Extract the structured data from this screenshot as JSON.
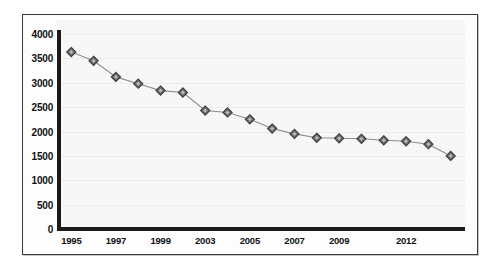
{
  "chart_data": {
    "type": "line",
    "title": "",
    "subtitle": "",
    "xlabel": "",
    "ylabel": "",
    "ylim": [
      0,
      4000
    ],
    "grid": true,
    "legend": null,
    "y_ticks": [
      "0",
      "500",
      "1000",
      "1500",
      "2000",
      "2500",
      "3000",
      "3500",
      "4000"
    ],
    "y_tick_values": [
      0,
      500,
      1000,
      1500,
      2000,
      2500,
      3000,
      3500,
      4000
    ],
    "x_tick_labels": [
      "1995",
      "1997",
      "1999",
      "2003",
      "2005",
      "2007",
      "2009",
      "2012"
    ],
    "x_tick_indices": [
      0,
      2,
      4,
      6,
      8,
      10,
      12,
      15
    ],
    "categories": [
      "1995",
      "1996",
      "1997",
      "1998",
      "1999",
      "2000",
      "2003",
      "2004",
      "2005",
      "2006",
      "2007",
      "2008",
      "2009",
      "2010",
      "2011",
      "2012",
      "2013",
      "2014"
    ],
    "values": [
      3630,
      3450,
      3120,
      2980,
      2840,
      2800,
      2430,
      2390,
      2250,
      2060,
      1950,
      1870,
      1860,
      1850,
      1820,
      1800,
      1740,
      1500
    ],
    "marker": "diamond",
    "marker_fill": "#6e6e6e",
    "marker_stroke": "#3b3b3b",
    "line_color": "#8d8d8d",
    "plot_background": "#f7f7f7",
    "axis_color": "#1a1a1a",
    "frame_border_color": "#3a3a3a"
  }
}
